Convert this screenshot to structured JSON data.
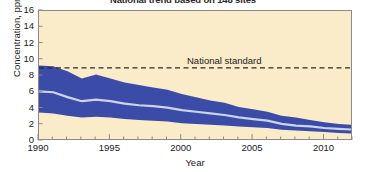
{
  "chart_data": {
    "type": "area",
    "title": "National trend based on 148 sites",
    "xlabel": "Year",
    "ylabel": "Concentration, ppm",
    "xlim": [
      1990,
      2012
    ],
    "ylim": [
      0,
      16
    ],
    "ytick_values": [
      0,
      2,
      4,
      6,
      8,
      10,
      12,
      14,
      16
    ],
    "ytick_labels": [
      "0",
      "2",
      "4",
      "6",
      "8",
      "10",
      "12",
      "14",
      "16"
    ],
    "xtick_values": [
      1990,
      1995,
      2000,
      2005,
      2010
    ],
    "xtick_labels": [
      "1990",
      "1995",
      "2000",
      "2005",
      "2010"
    ],
    "minor_xtick_step": 1,
    "grid": false,
    "legend": "none",
    "plot_background": "#fbecc9",
    "band_color": "#3b4ba8",
    "median_color": "#ccd4ec",
    "axis_color": "#8a8a8a",
    "text_color": "#1a1a1a",
    "x": [
      1990,
      1991,
      1992,
      1993,
      1994,
      1995,
      1996,
      1997,
      1998,
      1999,
      2000,
      2001,
      2002,
      2003,
      2004,
      2005,
      2006,
      2007,
      2008,
      2009,
      2010,
      2011,
      2012
    ],
    "series": [
      {
        "name": "90th percentile",
        "role": "band-upper",
        "values": [
          9.3,
          9.2,
          8.6,
          7.7,
          8.2,
          7.7,
          7.2,
          6.9,
          6.6,
          6.3,
          5.8,
          5.4,
          5.0,
          4.7,
          4.2,
          3.9,
          3.6,
          3.1,
          2.9,
          2.6,
          2.3,
          2.1,
          2.0
        ]
      },
      {
        "name": "Median",
        "role": "median-line",
        "values": [
          6.1,
          6.0,
          5.4,
          4.9,
          5.1,
          4.9,
          4.6,
          4.4,
          4.3,
          4.1,
          3.8,
          3.6,
          3.4,
          3.2,
          2.9,
          2.7,
          2.5,
          2.1,
          1.9,
          1.8,
          1.6,
          1.5,
          1.4
        ]
      },
      {
        "name": "10th percentile",
        "role": "band-lower",
        "values": [
          3.5,
          3.4,
          3.1,
          2.9,
          3.0,
          2.9,
          2.7,
          2.6,
          2.5,
          2.4,
          2.2,
          2.1,
          2.0,
          1.9,
          1.8,
          1.7,
          1.6,
          1.4,
          1.3,
          1.2,
          1.1,
          1.0,
          0.9
        ]
      }
    ],
    "annotations": [
      {
        "name": "national-standard",
        "label": "National standard",
        "y_value": 9,
        "style": "dashed-horizontal-line"
      }
    ]
  }
}
